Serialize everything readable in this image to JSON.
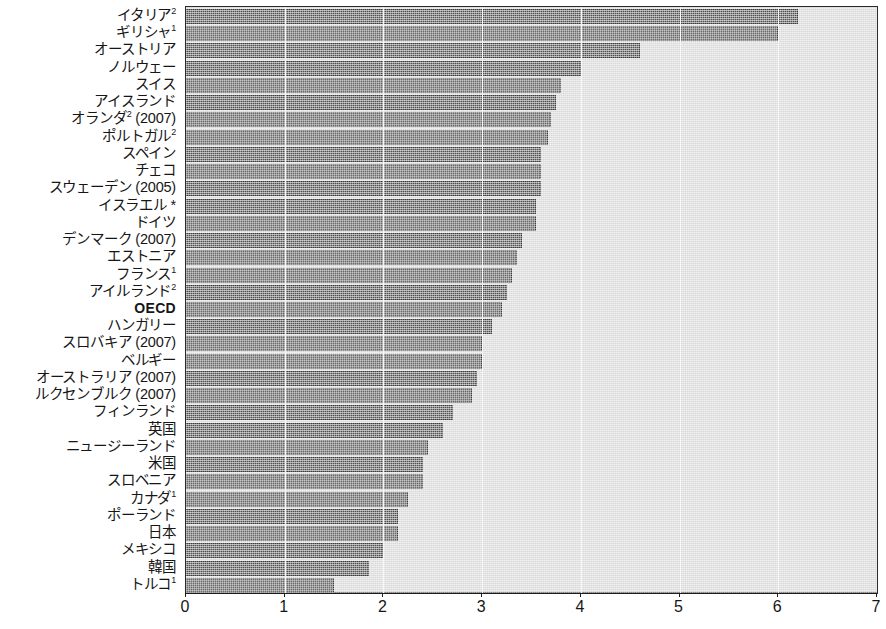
{
  "chart_data": {
    "type": "bar",
    "orientation": "horizontal",
    "title": "",
    "subtitle": "",
    "xlabel": "",
    "ylabel": "",
    "xlim": [
      0,
      7
    ],
    "xticks": [
      "0",
      "1",
      "2",
      "3",
      "4",
      "5",
      "6",
      "7"
    ],
    "grid": true,
    "legend": null,
    "bar_color": "#5b5b5b",
    "panel_color": "#d8d8d8",
    "gridline_color": "#f4f4f4",
    "axis_color": "#1d1d1d",
    "categories": [
      "イタリア²",
      "ギリシャ¹",
      "オーストリア",
      "ノルウェー",
      "スイス",
      "アイスランド",
      "オランダ² (2007)",
      "ポルトガル²",
      "スペイン",
      "チェコ",
      "スウェーデン (2005)",
      "イスラエル *",
      "ドイツ",
      "デンマーク (2007)",
      "エストニア",
      "フランス¹",
      "アイルランド²",
      "OECD",
      "ハンガリー",
      "スロバキア (2007)",
      "ベルギー",
      "オーストラリア (2007)",
      "ルクセンブルク (2007)",
      "フィンランド",
      "英国",
      "ニュージーランド",
      "米国",
      "スロベニア",
      "カナダ¹",
      "ポーランド",
      "日本",
      "メキシコ",
      "韓国",
      "トルコ¹"
    ],
    "values": [
      6.2,
      6.0,
      4.6,
      4.0,
      3.8,
      3.75,
      3.7,
      3.67,
      3.6,
      3.6,
      3.6,
      3.55,
      3.55,
      3.4,
      3.35,
      3.3,
      3.25,
      3.2,
      3.1,
      3.0,
      3.0,
      2.95,
      2.9,
      2.7,
      2.6,
      2.45,
      2.4,
      2.4,
      2.25,
      2.15,
      2.15,
      2.0,
      1.85,
      1.5
    ],
    "highlight_index": 17,
    "highlight_label": "OECD"
  }
}
